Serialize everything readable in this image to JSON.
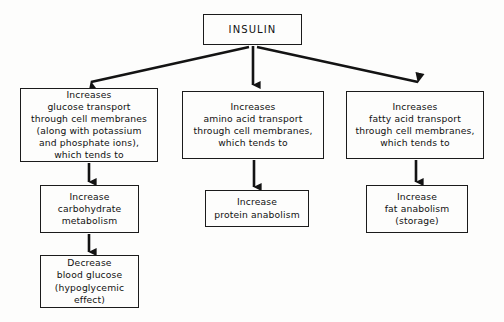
{
  "diagram": {
    "type": "flowchart",
    "orientation": "top-down",
    "background_color": "#fdfdfc",
    "line_color": "#1b1b1b",
    "text_color": "#111111",
    "nodes": {
      "insulin": {
        "id": "insulin",
        "label": "INSULIN",
        "role": "root"
      },
      "glucose": {
        "id": "glucose",
        "label": "Increases\nglucose transport\nthrough cell membranes\n(along with potassium\nand phosphate ions),\nwhich tends to",
        "role": "branch"
      },
      "amino": {
        "id": "amino",
        "label": "Increases\namino acid transport\nthrough cell membranes,\nwhich tends to",
        "role": "branch"
      },
      "fatty": {
        "id": "fatty",
        "label": "Increases\nfatty acid transport\nthrough cell membranes,\nwhich tends to",
        "role": "branch"
      },
      "carb": {
        "id": "carb",
        "label": "Increase\ncarbohydrate\nmetabolism",
        "role": "outcome"
      },
      "protein": {
        "id": "protein",
        "label": "Increase\nprotein anabolism",
        "role": "outcome"
      },
      "fat": {
        "id": "fat",
        "label": "Increase\nfat anabolism\n(storage)",
        "role": "outcome"
      },
      "decrease": {
        "id": "decrease",
        "label": "Decrease\nblood glucose\n(hypoglycemic\neffect)",
        "role": "outcome"
      }
    },
    "edges": [
      {
        "from": "insulin",
        "to": "glucose",
        "style": "diagonal-left",
        "arrowhead": true
      },
      {
        "from": "insulin",
        "to": "amino",
        "style": "vertical",
        "arrowhead": true
      },
      {
        "from": "insulin",
        "to": "fatty",
        "style": "diagonal-right",
        "arrowhead": true
      },
      {
        "from": "glucose",
        "to": "carb",
        "style": "vertical",
        "arrowhead": true
      },
      {
        "from": "amino",
        "to": "protein",
        "style": "vertical",
        "arrowhead": true
      },
      {
        "from": "fatty",
        "to": "fat",
        "style": "vertical",
        "arrowhead": true
      },
      {
        "from": "carb",
        "to": "decrease",
        "style": "vertical",
        "arrowhead": true
      }
    ]
  }
}
